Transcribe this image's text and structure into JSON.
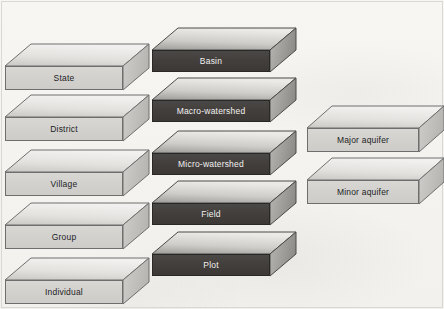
{
  "diagram": {
    "background_color": "#f6f5f2",
    "columns": [
      {
        "name": "administrative-units",
        "style": "light",
        "slabs": [
          {
            "label": "State",
            "x": 5,
            "y": 44,
            "w": 118,
            "h": 24,
            "depth": 22,
            "skew": 26
          },
          {
            "label": "District",
            "x": 5,
            "y": 95,
            "w": 118,
            "h": 24,
            "depth": 22,
            "skew": 26
          },
          {
            "label": "Village",
            "x": 5,
            "y": 150,
            "w": 118,
            "h": 24,
            "depth": 22,
            "skew": 26
          },
          {
            "label": "Group",
            "x": 5,
            "y": 203,
            "w": 118,
            "h": 24,
            "depth": 22,
            "skew": 26
          },
          {
            "label": "Individual",
            "x": 5,
            "y": 258,
            "w": 118,
            "h": 24,
            "depth": 22,
            "skew": 26
          }
        ]
      },
      {
        "name": "watershed-units",
        "style": "dark",
        "slabs": [
          {
            "label": "Basin",
            "x": 152,
            "y": 28,
            "w": 118,
            "h": 22,
            "depth": 22,
            "skew": 26
          },
          {
            "label": "Macro-watershed",
            "x": 152,
            "y": 78,
            "w": 118,
            "h": 22,
            "depth": 22,
            "skew": 26
          },
          {
            "label": "Micro-watershed",
            "x": 152,
            "y": 131,
            "w": 118,
            "h": 22,
            "depth": 22,
            "skew": 26
          },
          {
            "label": "Field",
            "x": 152,
            "y": 181,
            "w": 118,
            "h": 22,
            "depth": 22,
            "skew": 26
          },
          {
            "label": "Plot",
            "x": 152,
            "y": 232,
            "w": 118,
            "h": 22,
            "depth": 22,
            "skew": 26
          }
        ]
      },
      {
        "name": "aquifer-units",
        "style": "light",
        "slabs": [
          {
            "label": "Major aquifer",
            "x": 307,
            "y": 106,
            "w": 112,
            "h": 24,
            "depth": 22,
            "skew": 25
          },
          {
            "label": "Minor aquifer",
            "x": 307,
            "y": 158,
            "w": 112,
            "h": 24,
            "depth": 22,
            "skew": 25
          }
        ]
      }
    ]
  }
}
